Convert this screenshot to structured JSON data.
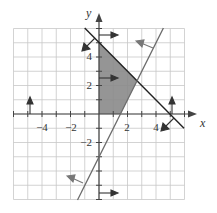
{
  "graph": {
    "x_axis_label": "x",
    "y_axis_label": "y",
    "x_tick_labels": [
      {
        "value": -4,
        "text": "−4"
      },
      {
        "value": -2,
        "text": "−2"
      },
      {
        "value": 2,
        "text": "2"
      },
      {
        "value": 4,
        "text": "4"
      }
    ],
    "y_tick_labels": [
      {
        "value": 4,
        "text": "4"
      },
      {
        "value": 2,
        "text": "2"
      },
      {
        "value": -2,
        "text": "−2"
      }
    ],
    "range": {
      "xmin": -6,
      "xmax": 6,
      "ymin": -6,
      "ymax": 6
    },
    "colors": {
      "grid": "#c8c8c8",
      "axis": "#444444",
      "line1": "#222222",
      "line2": "#6a6a6a",
      "shade": "#8a8a8a",
      "arrow": "#333333"
    }
  },
  "chart_data": {
    "type": "line",
    "title": "",
    "xlabel": "x",
    "ylabel": "y",
    "xlim": [
      -6,
      6
    ],
    "ylim": [
      -6,
      6
    ],
    "grid": true,
    "series": [
      {
        "name": "x + y = 5",
        "points": [
          [
            -1,
            6
          ],
          [
            6,
            -1
          ]
        ],
        "shade_side": "below-left"
      },
      {
        "name": "y = 2x - 3",
        "points": [
          [
            -1.5,
            -6
          ],
          [
            4.5,
            6
          ]
        ],
        "shade_side": "above-left"
      },
      {
        "name": "x = 0",
        "shade_side": "right"
      },
      {
        "name": "y = 0",
        "shade_side": "above"
      }
    ],
    "feasible_region": {
      "vertices": [
        [
          0,
          0
        ],
        [
          0,
          5
        ],
        [
          2.667,
          2.333
        ],
        [
          1.5,
          0
        ]
      ],
      "fill": "shaded gray"
    },
    "annotations": [
      "direction arrows indicate half-plane of each inequality"
    ]
  }
}
